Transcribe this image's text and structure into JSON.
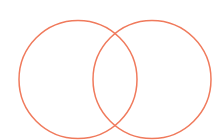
{
  "diagram": {
    "type": "venn",
    "canvas": {
      "width": 213,
      "height": 140,
      "background": "#ffffff"
    },
    "stroke_color": "#f07a5c",
    "stroke_width": 1.5,
    "sets": [
      {
        "id": "left",
        "cx": 78,
        "cy": 79.5,
        "r": 59
      },
      {
        "id": "right",
        "cx": 152,
        "cy": 79.5,
        "r": 59
      }
    ],
    "labels": []
  }
}
